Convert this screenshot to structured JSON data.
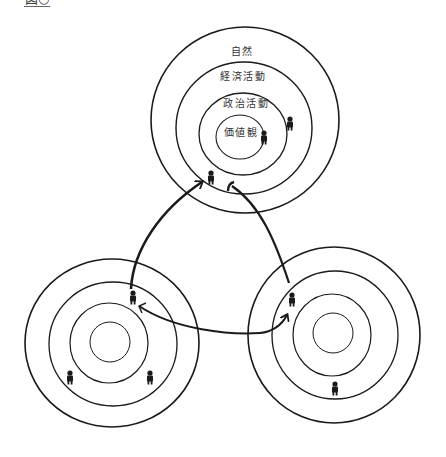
{
  "figure": {
    "label": "図○"
  },
  "ring_labels": {
    "outer": "自然",
    "second": "経済活動",
    "third": "政治活動",
    "inner": "価値観"
  },
  "colors": {
    "line": "#1a1a1a",
    "text": "#333333",
    "background": "#ffffff"
  },
  "communities": [
    {
      "name": "top",
      "cx": 245,
      "cy": 118,
      "radii": [
        94,
        70,
        46,
        25
      ],
      "people": [
        [
          290,
          124
        ],
        [
          264,
          138
        ],
        [
          211,
          178
        ]
      ]
    },
    {
      "name": "left",
      "cx": 110,
      "cy": 342,
      "radii": [
        87,
        63,
        40,
        20
      ],
      "people": [
        [
          133,
          298
        ],
        [
          70,
          378
        ],
        [
          150,
          378
        ]
      ]
    },
    {
      "name": "right",
      "cx": 333,
      "cy": 333,
      "radii": [
        87,
        63,
        40,
        20
      ],
      "people": [
        [
          291,
          300
        ],
        [
          335,
          389
        ]
      ]
    }
  ],
  "arrows": [
    {
      "from": "left",
      "to": "top",
      "description": "left community to top community"
    },
    {
      "from": "right",
      "to": "top",
      "description": "right community to top community"
    },
    {
      "from": "left",
      "to": "right",
      "description": "bidirectional exchange between left and right"
    }
  ]
}
